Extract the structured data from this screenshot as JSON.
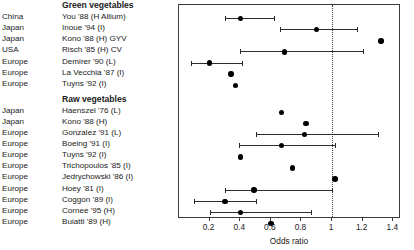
{
  "chart_data": {
    "type": "scatter",
    "title": "",
    "xlabel": "Odds ratio",
    "ylabel": "",
    "xlim": [
      0.0,
      1.45
    ],
    "xticks": [
      0.2,
      0.4,
      0.6,
      0.8,
      1.0,
      1.2,
      1.4
    ],
    "xticklabels": [
      "0.2",
      "0.4",
      "0.6",
      "0.8",
      "1",
      "1.2",
      "1.4"
    ],
    "grid": false,
    "legend": null,
    "reference_line": 1.0,
    "reference_line_style": "dotted",
    "marker": "filled-circle",
    "groups": [
      {
        "name": "Green vegetables",
        "rows": [
          {
            "region": "China",
            "study": "You '88 (H Allium)",
            "odds_ratio": 0.4,
            "ci_low": 0.3,
            "ci_high": 0.62
          },
          {
            "region": "Japan",
            "study": "Inoue '94 (I)",
            "odds_ratio": 0.9,
            "ci_low": 0.66,
            "ci_high": 1.16
          },
          {
            "region": "Japan",
            "study": "Kono '88 (H) GYV",
            "odds_ratio": 1.32,
            "ci_low": null,
            "ci_high": null
          },
          {
            "region": "USA",
            "study": "Risch '85 (H) CV",
            "odds_ratio": 0.69,
            "ci_low": 0.4,
            "ci_high": 1.2
          },
          {
            "region": "Europe",
            "study": "Demirer '90 (L)",
            "odds_ratio": 0.2,
            "ci_low": 0.08,
            "ci_high": 0.41
          },
          {
            "region": "Europe",
            "study": "La Vecchia '87 (I)",
            "odds_ratio": 0.34,
            "ci_low": null,
            "ci_high": null
          },
          {
            "region": "Europe",
            "study": "Tuyns '92 (I)",
            "odds_ratio": 0.37,
            "ci_low": null,
            "ci_high": null
          }
        ]
      },
      {
        "name": "Raw vegetables",
        "rows": [
          {
            "region": "Japan",
            "study": "Haenszel '76 (L)",
            "odds_ratio": 0.67,
            "ci_low": null,
            "ci_high": null
          },
          {
            "region": "Japan",
            "study": "Kono '88 (H)",
            "odds_ratio": 0.83,
            "ci_low": null,
            "ci_high": null
          },
          {
            "region": "Europe",
            "study": "Gonzalez '91 (L)",
            "odds_ratio": 0.82,
            "ci_low": 0.5,
            "ci_high": 1.3
          },
          {
            "region": "Europe",
            "study": "Boeing '91 (I)",
            "odds_ratio": 0.67,
            "ci_low": 0.39,
            "ci_high": 1.02
          },
          {
            "region": "Europe",
            "study": "Tuyns '92 (I)",
            "odds_ratio": 0.4,
            "ci_low": null,
            "ci_high": null
          },
          {
            "region": "Europe",
            "study": "Trichopoulos '85 (I)",
            "odds_ratio": 0.74,
            "ci_low": null,
            "ci_high": null
          },
          {
            "region": "Europe",
            "study": "Jedrychowski '86 (I)",
            "odds_ratio": 1.02,
            "ci_low": null,
            "ci_high": null
          },
          {
            "region": "Europe",
            "study": "Hoey '81 (I)",
            "odds_ratio": 0.49,
            "ci_low": 0.3,
            "ci_high": 1.0
          },
          {
            "region": "Europe",
            "study": "Coggon '89 (I)",
            "odds_ratio": 0.3,
            "ci_low": 0.1,
            "ci_high": 0.5
          },
          {
            "region": "Europe",
            "study": "Cornee '95 (H)",
            "odds_ratio": 0.4,
            "ci_low": 0.2,
            "ci_high": 0.86
          },
          {
            "region": "Europe",
            "study": "Buiatti '89 (H)",
            "odds_ratio": 0.6,
            "ci_low": null,
            "ci_high": null
          }
        ]
      }
    ]
  }
}
